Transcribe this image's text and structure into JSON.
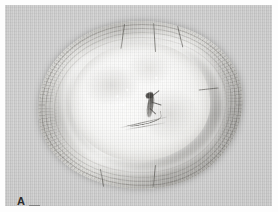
{
  "figure": {
    "panel_label": "A",
    "caption": "",
    "background_color": "#fdfdfd",
    "plate_background_color": "#c8c8c8",
    "label_color": "#2c2c2c"
  },
  "photograph": {
    "type": "grayscale-photograph",
    "subject": "tree trunk cross-section",
    "description": "Transverse section of a woody stem showing a broad outer bark ring with radial fibres and concentric growth bands, a pale inner sapwood core, radial cracks in the bark, and a dark elongate lesion with fine streaks near the centre-right of the core.",
    "regions": [
      {
        "name": "outer-bark-ring",
        "tone": "mid-gray",
        "color": "#9e9c97"
      },
      {
        "name": "growth-ring-bands",
        "tone": "gray",
        "color": "#6e6c68"
      },
      {
        "name": "inner-sapwood-core",
        "tone": "near-white",
        "color": "#fafaf9"
      },
      {
        "name": "pale-halo",
        "tone": "white",
        "color": "#ffffff"
      },
      {
        "name": "central-lesion",
        "tone": "dark",
        "color": "#3a3834"
      }
    ],
    "features": {
      "radial_cracks": 6,
      "concentric_ring_bands": 4,
      "pale_specks": 5
    }
  },
  "icons": {
    "panel_label_icon": "letter-a-label",
    "scale_bar_icon": "scale-bar"
  }
}
